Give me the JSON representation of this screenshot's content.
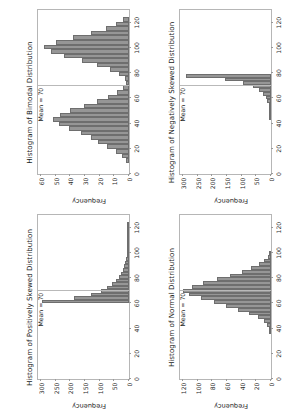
{
  "figure": {
    "rotation_degrees": -90,
    "background": "#ffffff",
    "bar_color": "#969696",
    "bar_edge_color": "#6e6e6e",
    "frame_color": "#b6b6b6",
    "mean_line_color": "#b9b9b9"
  },
  "chart_data": [
    {
      "type": "bar",
      "id": "positively-skewed",
      "title": "Histogram of Positively Skewed Distribution",
      "xlabel": "",
      "ylabel": "Frequency",
      "xlim": [
        0,
        130
      ],
      "ylim": [
        0,
        310
      ],
      "xticks": [
        0,
        20,
        40,
        60,
        80,
        100,
        120
      ],
      "yticks": [
        0,
        50,
        100,
        150,
        200,
        250,
        300
      ],
      "grid": false,
      "annotation": "Mean = 70",
      "mean": 70,
      "bin_width": 2.8,
      "bin_centers": [
        61.4,
        64.2,
        67.0,
        69.8,
        72.6,
        75.4,
        78.2,
        81.0,
        83.8,
        86.6,
        89.4,
        92.2,
        95.0,
        97.8,
        100.6,
        103.4,
        106.2,
        109.0,
        111.8,
        114.6,
        117.4,
        120.2,
        123.0
      ],
      "values": [
        298,
        186,
        128,
        96,
        74,
        58,
        45,
        34,
        26,
        20,
        16,
        12,
        9,
        7,
        5,
        4,
        3,
        2,
        2,
        1,
        1,
        1,
        1
      ]
    },
    {
      "type": "bar",
      "id": "bimodal",
      "title": "Histogram of Bimodal Distribution",
      "xlabel": "",
      "ylabel": "Frequency",
      "xlim": [
        0,
        130
      ],
      "ylim": [
        0,
        62
      ],
      "xticks": [
        0,
        20,
        40,
        60,
        80,
        100,
        120
      ],
      "yticks": [
        0,
        10,
        20,
        30,
        40,
        50,
        60
      ],
      "grid": false,
      "annotation": "Mean = 70",
      "mean": 70,
      "bin_width": 3.6,
      "bin_centers": [
        10.8,
        14.4,
        18.0,
        21.6,
        25.2,
        28.8,
        32.4,
        36.0,
        39.6,
        43.2,
        46.8,
        50.4,
        54.0,
        57.6,
        61.2,
        64.8,
        68.4,
        72.0,
        75.6,
        79.2,
        82.8,
        86.4,
        90.0,
        93.6,
        97.2,
        100.8,
        104.4,
        108.0,
        111.6,
        115.2,
        118.8,
        122.4
      ],
      "values": [
        2,
        5,
        9,
        15,
        21,
        26,
        33,
        41,
        48,
        52,
        47,
        40,
        31,
        22,
        14,
        8,
        4,
        2,
        3,
        7,
        13,
        22,
        32,
        44,
        53,
        58,
        50,
        38,
        26,
        16,
        9,
        4
      ]
    },
    {
      "type": "bar",
      "id": "normal",
      "title": "Histogram of Normal Distribution",
      "xlabel": "",
      "ylabel": "Frequency",
      "xlim": [
        0,
        130
      ],
      "ylim": [
        0,
        124
      ],
      "xticks": [
        0,
        20,
        40,
        60,
        80,
        100,
        120
      ],
      "yticks": [
        0,
        20,
        40,
        60,
        80,
        100,
        120
      ],
      "grid": false,
      "annotation": "Mean = 70",
      "mean": 70,
      "bin_width": 3.0,
      "bin_centers": [
        37.0,
        40.0,
        43.0,
        46.0,
        49.0,
        52.0,
        55.0,
        58.0,
        61.0,
        64.0,
        67.0,
        70.0,
        73.0,
        76.0,
        79.0,
        82.0,
        85.0,
        88.0,
        91.0,
        94.0,
        97.0,
        100.0
      ],
      "values": [
        1,
        2,
        5,
        10,
        18,
        30,
        45,
        62,
        78,
        96,
        112,
        120,
        108,
        92,
        74,
        56,
        40,
        27,
        16,
        9,
        4,
        2
      ]
    },
    {
      "type": "bar",
      "id": "negatively-skewed",
      "title": "Histogram of Negatively Skewed Distribution",
      "xlabel": "",
      "ylabel": "Frequency",
      "xlim": [
        0,
        130
      ],
      "ylim": [
        0,
        310
      ],
      "xticks": [
        0,
        20,
        40,
        60,
        80,
        100,
        120
      ],
      "yticks": [
        0,
        50,
        100,
        150,
        200,
        250,
        300
      ],
      "grid": false,
      "annotation": "Mean = 70",
      "mean": 70,
      "bin_width": 2.8,
      "bin_centers": [
        44.0,
        46.8,
        49.6,
        52.4,
        55.2,
        58.0,
        60.8,
        63.6,
        66.4,
        69.2,
        72.0,
        74.8,
        77.6
      ],
      "values": [
        1,
        2,
        3,
        5,
        8,
        12,
        18,
        28,
        42,
        62,
        96,
        158,
        290
      ]
    }
  ]
}
